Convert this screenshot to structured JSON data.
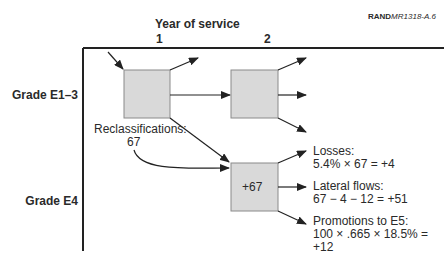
{
  "credit": {
    "bold": "RAND",
    "italic": "MR1318-A.6"
  },
  "x_axis": {
    "title": "Year of service",
    "ticks": [
      "1",
      "2"
    ]
  },
  "y_axis": {
    "rows": [
      "Grade E1–3",
      "Grade E4"
    ]
  },
  "boxes": [
    {
      "id": "e13-year1",
      "label": ""
    },
    {
      "id": "e13-year2",
      "label": ""
    },
    {
      "id": "e4-year2",
      "label": "+67"
    }
  ],
  "reclassifications": {
    "label": "Reclassifications:",
    "value": "67"
  },
  "outflows": [
    {
      "title": "Losses:",
      "lines": [
        "5.4% × 67 = +4"
      ]
    },
    {
      "title": "Lateral flows:",
      "lines": [
        "67 − 4 − 12 = +51"
      ]
    },
    {
      "title": "Promotions to E5:",
      "lines": [
        "100 × .665 × 18.5% =",
        "+12"
      ]
    }
  ],
  "colors": {
    "box_fill": "#d9d9d9",
    "box_border": "#8a8a8a",
    "line": "#222222"
  }
}
